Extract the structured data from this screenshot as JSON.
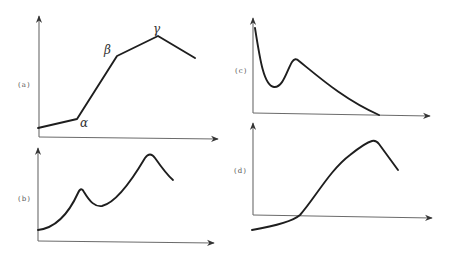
{
  "panels": [
    {
      "id": "a",
      "label": "(a)",
      "shape": "piecewise-linear",
      "points": [
        [
          38,
          128
        ],
        [
          77,
          119
        ],
        [
          117,
          56
        ],
        [
          158,
          36
        ],
        [
          195,
          58
        ]
      ],
      "annotations": [
        {
          "text": "α",
          "at": "first knee"
        },
        {
          "text": "β",
          "at": "second knee"
        },
        {
          "text": "γ",
          "at": "peak"
        }
      ]
    },
    {
      "id": "b",
      "label": "(b)",
      "shape": "two-peak curve",
      "points": [
        [
          38,
          230
        ],
        [
          81,
          189
        ],
        [
          100,
          206
        ],
        [
          150,
          154
        ],
        [
          173,
          180
        ]
      ]
    },
    {
      "id": "c",
      "label": "(c)",
      "shape": "decay with bump",
      "points": [
        [
          254,
          28
        ],
        [
          273,
          87
        ],
        [
          295,
          58
        ],
        [
          379,
          115
        ]
      ]
    },
    {
      "id": "d",
      "label": "(d)",
      "shape": "sigmoid-rise then drop",
      "points": [
        [
          252,
          230
        ],
        [
          300,
          216
        ],
        [
          375,
          141
        ],
        [
          398,
          170
        ]
      ]
    }
  ],
  "labels": {
    "a": "(a)",
    "b": "(b)",
    "c": "(c)",
    "d": "(d)",
    "alpha": "α",
    "beta": "β",
    "gamma": "γ"
  },
  "colors": {
    "curve": "#1e1e1e",
    "axis": "#6b6b6b",
    "label": "#555555"
  }
}
